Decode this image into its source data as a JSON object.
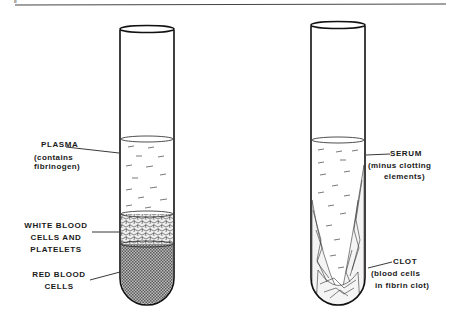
{
  "figure": {
    "corner_mark": "ll",
    "left_tube": {
      "name": "whole blood (unclotted, centrifuged)",
      "labels": [
        {
          "title": "PLASMA",
          "subtitle_lines": [
            "(contains",
            "fibrinogen)"
          ]
        },
        {
          "title_lines": [
            "WHITE BLOOD",
            "CELLS AND",
            "PLATELETS"
          ]
        },
        {
          "title_lines": [
            "RED BLOOD",
            "CELLS"
          ]
        }
      ]
    },
    "right_tube": {
      "name": "clotted blood",
      "labels": [
        {
          "title": "SERUM",
          "subtitle_lines": [
            "(minus clotting",
            "elements)"
          ]
        },
        {
          "title": "CLOT",
          "subtitle_lines": [
            "(blood cells",
            "in fibrin clot)"
          ]
        }
      ]
    },
    "colors": {
      "ink": "#1a1a1a",
      "background": "#ffffff",
      "rbc_fill": "#8c8c8c"
    }
  }
}
